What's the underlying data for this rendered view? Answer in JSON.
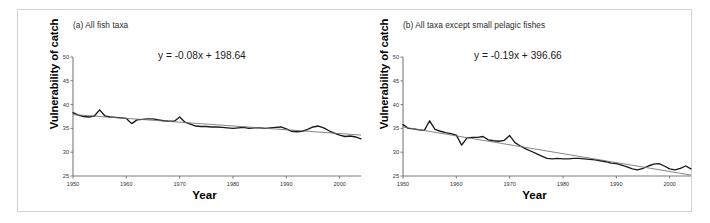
{
  "figure": {
    "panels": [
      {
        "key": "a",
        "title": "(a) All fish taxa",
        "equation": "y = -0.08x + 198.64",
        "xlabel": "Year",
        "ylabel": "Vulnerability of catch"
      },
      {
        "key": "b",
        "title": "(b) All taxa except small pelagic fishes",
        "equation": "y = -0.19x + 396.66",
        "xlabel": "Year",
        "ylabel": "Vulnerability of catch"
      }
    ],
    "colors": {
      "series_line": "#1a1a1a",
      "trend_line": "#6f6f6f",
      "axis": "#7a7a7a",
      "frame_border": "#d2d2d2",
      "text": "#1a1a1a",
      "title_text": "#2b2b2b",
      "background": "#ffffff"
    }
  },
  "chart_data": [
    {
      "type": "line",
      "title": "(a) All fish taxa",
      "xlabel": "Year",
      "ylabel": "Vulnerability of catch",
      "xlim": [
        1950,
        2004
      ],
      "ylim": [
        25,
        50
      ],
      "yticks": [
        25,
        30,
        35,
        40,
        45,
        50
      ],
      "ytick_labels": [
        "25",
        "30",
        "35",
        "40",
        "45",
        "50"
      ],
      "xticks": [
        1950,
        1960,
        1970,
        1980,
        1990,
        2000
      ],
      "xtick_labels": [
        "1950",
        "1960",
        "1970",
        "1980",
        "1990",
        "2000"
      ],
      "grid": false,
      "legend": "none",
      "annotations": [
        "y = -0.08x + 198.64"
      ],
      "series": [
        {
          "name": "Vulnerability of catch (all fish taxa)",
          "color": "#1a1a1a",
          "x": [
            1950,
            1951,
            1952,
            1953,
            1954,
            1955,
            1956,
            1957,
            1958,
            1959,
            1960,
            1961,
            1962,
            1963,
            1964,
            1965,
            1966,
            1967,
            1968,
            1969,
            1970,
            1971,
            1972,
            1973,
            1974,
            1975,
            1976,
            1977,
            1978,
            1979,
            1980,
            1981,
            1982,
            1983,
            1984,
            1985,
            1986,
            1987,
            1988,
            1989,
            1990,
            1991,
            1992,
            1993,
            1994,
            1995,
            1996,
            1997,
            1998,
            1999,
            2000,
            2001,
            2002,
            2003,
            2004
          ],
          "y": [
            38.3,
            37.8,
            37.5,
            37.4,
            37.6,
            38.9,
            37.6,
            37.4,
            37.3,
            37.2,
            37.1,
            36.0,
            36.8,
            36.9,
            37.0,
            37.0,
            36.8,
            36.6,
            36.5,
            36.5,
            37.4,
            36.3,
            35.9,
            35.5,
            35.4,
            35.4,
            35.3,
            35.3,
            35.2,
            35.1,
            35.0,
            35.1,
            35.2,
            35.0,
            35.1,
            35.1,
            35.0,
            35.1,
            35.2,
            35.3,
            34.9,
            34.4,
            34.3,
            34.4,
            34.8,
            35.3,
            35.5,
            35.1,
            34.5,
            34.0,
            33.6,
            33.3,
            33.4,
            33.2,
            32.8
          ]
        },
        {
          "name": "Linear trend",
          "color": "#6f6f6f",
          "type": "trendline",
          "slope": -0.08,
          "intercept": 198.64,
          "x": [
            1950,
            2004
          ],
          "y": [
            42.64,
            38.32
          ],
          "y_drawn": [
            37.9,
            33.6
          ]
        }
      ]
    },
    {
      "type": "line",
      "title": "(b) All taxa except small pelagic fishes",
      "xlabel": "Year",
      "ylabel": "Vulnerability of catch",
      "xlim": [
        1950,
        2004
      ],
      "ylim": [
        25,
        50
      ],
      "yticks": [
        25,
        30,
        35,
        40,
        45,
        50
      ],
      "ytick_labels": [
        "25",
        "30",
        "35",
        "40",
        "45",
        "50"
      ],
      "xticks": [
        1950,
        1960,
        1970,
        1980,
        1990,
        2000
      ],
      "xtick_labels": [
        "1950",
        "1960",
        "1970",
        "1980",
        "1990",
        "2000"
      ],
      "grid": false,
      "legend": "none",
      "annotations": [
        "y = -0.19x + 396.66"
      ],
      "series": [
        {
          "name": "Vulnerability of catch (excluding small pelagics)",
          "color": "#1a1a1a",
          "x": [
            1950,
            1951,
            1952,
            1953,
            1954,
            1955,
            1956,
            1957,
            1958,
            1959,
            1960,
            1961,
            1962,
            1963,
            1964,
            1965,
            1966,
            1967,
            1968,
            1969,
            1970,
            1971,
            1972,
            1973,
            1974,
            1975,
            1976,
            1977,
            1978,
            1979,
            1980,
            1981,
            1982,
            1983,
            1984,
            1985,
            1986,
            1987,
            1988,
            1989,
            1990,
            1991,
            1992,
            1993,
            1994,
            1995,
            1996,
            1997,
            1998,
            1999,
            2000,
            2001,
            2002,
            2003,
            2004
          ],
          "y": [
            35.8,
            35.0,
            34.9,
            34.7,
            34.6,
            36.6,
            34.8,
            34.4,
            34.1,
            33.9,
            33.6,
            31.5,
            33.0,
            33.1,
            33.1,
            33.3,
            32.6,
            32.4,
            32.3,
            32.5,
            33.5,
            32.0,
            31.3,
            30.7,
            30.2,
            29.7,
            29.2,
            28.7,
            28.6,
            28.7,
            28.6,
            28.6,
            28.7,
            28.7,
            28.6,
            28.5,
            28.4,
            28.2,
            28.0,
            27.7,
            27.6,
            27.3,
            26.9,
            26.5,
            26.3,
            26.6,
            27.1,
            27.5,
            27.6,
            27.1,
            26.5,
            26.3,
            26.6,
            27.1,
            26.5
          ]
        },
        {
          "name": "Linear trend",
          "color": "#6f6f6f",
          "type": "trendline",
          "slope": -0.19,
          "intercept": 396.66,
          "x": [
            1950,
            2004
          ],
          "y": [
            26.16,
            15.9
          ],
          "y_drawn": [
            35.3,
            25.2
          ]
        }
      ]
    }
  ]
}
